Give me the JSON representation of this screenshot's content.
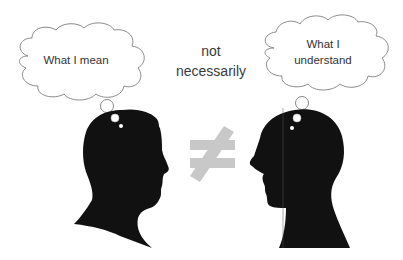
{
  "diagram": {
    "left": {
      "thought": "What I mean",
      "role": "speaker"
    },
    "right": {
      "thought_lines": [
        "What I",
        "understand"
      ],
      "role": "listener"
    },
    "middle": {
      "lines": [
        "not",
        "necessarily"
      ],
      "symbol": "≠",
      "symbol_name": "not-equal"
    },
    "colors": {
      "background": "#ffffff",
      "silhouette": "#111111",
      "cloud_stroke": "#8a8a8a",
      "cloud_fill": "#ffffff",
      "not_equal": "#c8c8c8",
      "text": "#333333"
    }
  }
}
